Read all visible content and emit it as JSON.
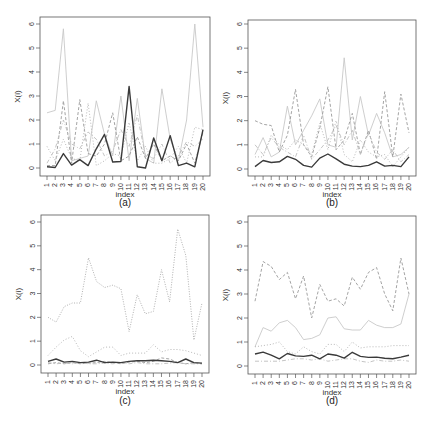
{
  "chart_data": [
    {
      "type": "line",
      "panel": "a",
      "caption": "(a)",
      "xlabel": "index",
      "ylabel": "X(i)",
      "ylim": [
        0,
        6
      ],
      "yticks": [
        0,
        1,
        2,
        3,
        4,
        5,
        6
      ],
      "x": [
        1,
        2,
        3,
        4,
        5,
        6,
        7,
        8,
        9,
        10,
        11,
        12,
        13,
        14,
        15,
        16,
        17,
        18,
        19,
        20
      ],
      "series": [
        {
          "name": "series-1",
          "style": "solid-dark",
          "values": [
            0.05,
            0.02,
            0.6,
            0.12,
            0.35,
            0.1,
            0.8,
            1.4,
            0.25,
            0.27,
            3.4,
            0.05,
            0.0,
            1.25,
            0.3,
            1.35,
            0.1,
            0.2,
            0.05,
            1.6
          ]
        },
        {
          "name": "series-2",
          "style": "solid-light",
          "values": [
            2.3,
            2.4,
            5.8,
            0.3,
            0.4,
            0.5,
            2.8,
            1.4,
            0.5,
            3.0,
            0.3,
            2.9,
            0.4,
            0.2,
            3.3,
            1.2,
            0.3,
            2.0,
            6.0,
            1.7
          ]
        },
        {
          "name": "series-3",
          "style": "dashed",
          "values": [
            0.1,
            0.1,
            2.8,
            0.2,
            2.85,
            0.6,
            0.5,
            1.0,
            2.3,
            0.3,
            0.5,
            1.3,
            0.4,
            1.0,
            0.3,
            0.5,
            0.3,
            1.0,
            0.2,
            1.5
          ]
        },
        {
          "name": "series-4",
          "style": "dotted",
          "values": [
            0.9,
            0.3,
            1.2,
            0.4,
            0.3,
            2.7,
            0.1,
            0.3,
            0.6,
            0.5,
            1.9,
            0.3,
            0.9,
            0.2,
            0.2,
            0.4,
            0.9,
            0.2,
            1.7,
            1.6
          ]
        },
        {
          "name": "series-5",
          "style": "dashdot",
          "values": [
            0.2,
            0.8,
            2.0,
            1.0,
            0.8,
            1.5,
            1.2,
            0.5,
            0.7,
            1.6,
            0.9,
            2.2,
            0.5,
            0.4,
            1.0,
            0.2,
            0.5,
            1.1,
            0.9,
            1.2
          ]
        }
      ]
    },
    {
      "type": "line",
      "panel": "b",
      "caption": "(b)",
      "xlabel": "index",
      "ylabel": "X(i)",
      "ylim": [
        0,
        6
      ],
      "yticks": [
        0,
        1,
        2,
        3,
        4,
        5,
        6
      ],
      "x": [
        1,
        2,
        3,
        4,
        5,
        6,
        7,
        8,
        9,
        10,
        11,
        12,
        13,
        14,
        15,
        16,
        17,
        18,
        19,
        20
      ],
      "series": [
        {
          "name": "series-1",
          "style": "solid-dark",
          "values": [
            0.1,
            0.35,
            0.27,
            0.3,
            0.52,
            0.4,
            0.15,
            0.08,
            0.45,
            0.62,
            0.42,
            0.2,
            0.12,
            0.1,
            0.15,
            0.3,
            0.12,
            0.15,
            0.1,
            0.5
          ]
        },
        {
          "name": "series-2",
          "style": "solid-light",
          "values": [
            0.6,
            1.3,
            0.5,
            0.7,
            2.6,
            1.0,
            1.6,
            2.2,
            2.9,
            1.0,
            0.9,
            4.6,
            1.2,
            3.0,
            1.4,
            2.3,
            1.5,
            0.5,
            0.6,
            0.9
          ]
        },
        {
          "name": "series-3",
          "style": "dashed",
          "values": [
            2.0,
            1.85,
            1.8,
            0.7,
            1.4,
            3.3,
            1.0,
            0.5,
            1.7,
            3.4,
            0.8,
            1.2,
            2.3,
            0.6,
            1.6,
            0.4,
            3.2,
            0.5,
            3.1,
            1.5
          ]
        },
        {
          "name": "series-4",
          "style": "dotted",
          "values": [
            0.5,
            0.5,
            1.4,
            1.0,
            0.8,
            1.2,
            1.0,
            0.6,
            1.9,
            0.8,
            2.0,
            0.6,
            0.3,
            1.2,
            0.7,
            0.5,
            0.6,
            0.1,
            0.5,
            0.9
          ]
        },
        {
          "name": "series-5",
          "style": "dashdot",
          "values": [
            1.0,
            0.6,
            1.3,
            0.9,
            0.7,
            0.5,
            1.4,
            0.4,
            0.8,
            1.2,
            1.8,
            1.0,
            1.6,
            0.6,
            1.5,
            0.7,
            0.4,
            0.8,
            0.3,
            0.6
          ]
        }
      ]
    },
    {
      "type": "line",
      "panel": "c",
      "caption": "(c)",
      "xlabel": "index",
      "ylabel": "X(i)",
      "ylim": [
        0,
        6
      ],
      "yticks": [
        0,
        1,
        2,
        3,
        4,
        5,
        6
      ],
      "x": [
        1,
        2,
        3,
        4,
        5,
        6,
        7,
        8,
        9,
        10,
        11,
        12,
        13,
        14,
        15,
        16,
        17,
        18,
        19,
        20
      ],
      "series": [
        {
          "name": "series-1",
          "style": "solid-dark",
          "values": [
            0.15,
            0.25,
            0.12,
            0.15,
            0.1,
            0.12,
            0.2,
            0.1,
            0.12,
            0.1,
            0.15,
            0.18,
            0.18,
            0.2,
            0.18,
            0.15,
            0.1,
            0.25,
            0.1,
            0.08
          ]
        },
        {
          "name": "series-2",
          "style": "dotted-tall",
          "values": [
            2.0,
            1.8,
            2.45,
            2.6,
            2.6,
            4.5,
            3.5,
            3.25,
            3.35,
            3.2,
            1.4,
            2.95,
            2.15,
            2.25,
            4.0,
            2.65,
            5.7,
            4.6,
            1.05,
            2.6
          ]
        },
        {
          "name": "series-3",
          "style": "dotted",
          "values": [
            0.4,
            0.75,
            1.05,
            1.2,
            0.6,
            0.35,
            0.55,
            0.75,
            0.75,
            0.4,
            0.5,
            0.5,
            0.5,
            0.85,
            0.55,
            0.65,
            0.65,
            0.6,
            0.5,
            0.4
          ]
        },
        {
          "name": "series-4",
          "style": "dashed",
          "values": [
            0.05,
            0.1,
            0.05,
            0.1,
            0.05,
            0.08,
            0.1,
            0.15,
            0.1,
            0.05,
            0.12,
            0.15,
            0.1,
            0.15,
            0.3,
            0.25,
            0.1,
            0.05,
            0.1,
            0.05
          ]
        },
        {
          "name": "series-5",
          "style": "dashdot",
          "values": [
            0.1,
            0.05,
            0.08,
            0.05,
            0.1,
            0.05,
            0.05,
            0.08,
            0.05,
            0.1,
            0.05,
            0.1,
            0.05,
            0.05,
            0.05,
            0.08,
            0.1,
            0.05,
            0.05,
            0.05
          ]
        }
      ]
    },
    {
      "type": "line",
      "panel": "d",
      "caption": "(d)",
      "xlabel": "index",
      "ylabel": "X(i)",
      "ylim": [
        0,
        6
      ],
      "yticks": [
        0,
        1,
        2,
        3,
        4,
        5,
        6
      ],
      "x": [
        1,
        2,
        3,
        4,
        5,
        6,
        7,
        8,
        9,
        10,
        11,
        12,
        13,
        14,
        15,
        16,
        17,
        18,
        19,
        20
      ],
      "series": [
        {
          "name": "series-1",
          "style": "solid-dark",
          "values": [
            0.5,
            0.58,
            0.45,
            0.3,
            0.52,
            0.42,
            0.4,
            0.45,
            0.3,
            0.5,
            0.45,
            0.33,
            0.57,
            0.4,
            0.36,
            0.37,
            0.32,
            0.3,
            0.37,
            0.45
          ]
        },
        {
          "name": "series-2",
          "style": "dashed",
          "values": [
            2.7,
            4.35,
            4.15,
            3.6,
            3.9,
            2.8,
            3.75,
            2.0,
            3.4,
            2.7,
            2.8,
            2.5,
            3.7,
            3.2,
            3.9,
            4.1,
            3.0,
            2.3,
            4.5,
            3.0
          ]
        },
        {
          "name": "series-3",
          "style": "solid-light",
          "values": [
            0.8,
            1.6,
            1.45,
            1.8,
            1.9,
            1.6,
            1.1,
            1.15,
            1.3,
            2.0,
            2.05,
            1.55,
            1.5,
            1.5,
            1.9,
            1.7,
            1.6,
            1.6,
            1.75,
            3.0
          ]
        },
        {
          "name": "series-4",
          "style": "dotted",
          "values": [
            0.8,
            0.85,
            0.9,
            1.0,
            0.6,
            0.5,
            0.8,
            0.6,
            0.5,
            0.9,
            0.9,
            0.6,
            1.0,
            0.75,
            0.8,
            0.8,
            0.8,
            0.85,
            0.85,
            0.85
          ]
        },
        {
          "name": "series-5",
          "style": "dashdot",
          "values": [
            0.2,
            0.2,
            0.2,
            0.2,
            0.25,
            0.3,
            0.3,
            0.25,
            0.3,
            0.2,
            0.25,
            0.3,
            0.3,
            0.2,
            0.15,
            0.25,
            0.2,
            0.2,
            0.25,
            0.2
          ]
        }
      ]
    }
  ],
  "panels": [
    {
      "caption": "(a)",
      "xlabel": "index",
      "ylabel": "X(i)"
    },
    {
      "caption": "(b)",
      "xlabel": "index",
      "ylabel": "X(i)"
    },
    {
      "caption": "(c)",
      "xlabel": "index",
      "ylabel": "X(i)"
    },
    {
      "caption": "(d)",
      "xlabel": "index",
      "ylabel": "X(i)"
    }
  ],
  "colors": {
    "solid-dark": "#3a3a3a",
    "solid-light": "#c8c8c8",
    "dashed": "#9a9a9a",
    "dotted": "#b0b0b0",
    "dotted-tall": "#a8a8a8",
    "dashdot": "#bdbdbd",
    "axis": "#555555"
  }
}
